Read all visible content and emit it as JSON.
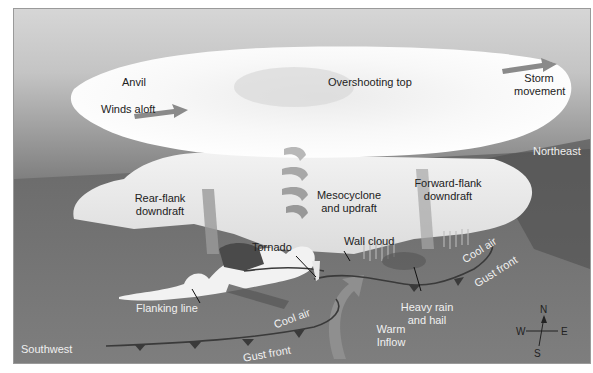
{
  "diagram": {
    "labels": {
      "anvil": "Anvil",
      "winds_aloft": "Winds aloft",
      "overshooting_top": "Overshooting top",
      "storm_movement_1": "Storm",
      "storm_movement_2": "movement",
      "northeast": "Northeast",
      "rear_flank_1": "Rear-flank",
      "rear_flank_2": "downdraft",
      "mesocyclone_1": "Mesocyclone",
      "mesocyclone_2": "and updraft",
      "forward_flank_1": "Forward-flank",
      "forward_flank_2": "downdraft",
      "tornado": "Tornado",
      "wall_cloud": "Wall cloud",
      "cool_air_right": "Cool air",
      "gust_front_right": "Gust front",
      "heavy_rain_1": "Heavy rain",
      "heavy_rain_2": "and hail",
      "flanking_line": "Flanking line",
      "cool_air_left": "Cool air",
      "warm_inflow_1": "Warm",
      "warm_inflow_2": "Inflow",
      "southwest": "Southwest",
      "gust_front_bottom": "Gust front"
    },
    "compass": {
      "north": "N",
      "south": "S",
      "east": "E",
      "west": "W"
    },
    "colors": {
      "arrow": "#8a8a8a",
      "cloud": "#f6f6f6",
      "ground": "#777777",
      "sky": "#d0d0d0",
      "front_line": "#3a3a3a"
    }
  }
}
